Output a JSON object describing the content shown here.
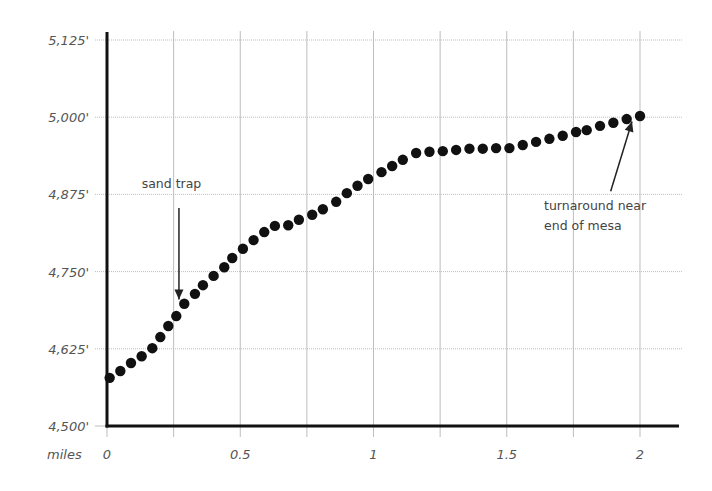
{
  "chart_data": {
    "type": "scatter",
    "title": "",
    "xlabel": "miles",
    "ylabel": "",
    "xlim": [
      0,
      2
    ],
    "ylim": [
      4500,
      5125
    ],
    "x_ticks": [
      0,
      0.5,
      1,
      1.5,
      2
    ],
    "x_tick_labels": [
      "0",
      "0.5",
      "1",
      "1.5",
      "2"
    ],
    "x_gridlines": [
      0.25,
      0.5,
      0.75,
      1,
      1.25,
      1.5,
      1.75,
      2
    ],
    "y_ticks": [
      4500,
      4625,
      4750,
      4875,
      5000,
      5125
    ],
    "y_tick_labels": [
      "4,500'",
      "4,625'",
      "4,750'",
      "4,875'",
      "5,000'",
      "5,125'"
    ],
    "grid": true,
    "legend": null,
    "series": [
      {
        "name": "elevation",
        "color": "#111111",
        "x": [
          0.01,
          0.05,
          0.09,
          0.13,
          0.17,
          0.2,
          0.23,
          0.26,
          0.29,
          0.33,
          0.36,
          0.4,
          0.44,
          0.47,
          0.51,
          0.55,
          0.59,
          0.63,
          0.68,
          0.72,
          0.77,
          0.81,
          0.86,
          0.9,
          0.94,
          0.98,
          1.03,
          1.07,
          1.11,
          1.16,
          1.21,
          1.26,
          1.31,
          1.36,
          1.41,
          1.46,
          1.51,
          1.56,
          1.61,
          1.66,
          1.71,
          1.76,
          1.8,
          1.85,
          1.9,
          1.95,
          2.0
        ],
        "y": [
          4578,
          4589,
          4602,
          4613,
          4626,
          4644,
          4662,
          4678,
          4698,
          4714,
          4728,
          4743,
          4757,
          4772,
          4787,
          4801,
          4814,
          4824,
          4825,
          4834,
          4842,
          4851,
          4863,
          4877,
          4889,
          4900,
          4911,
          4921,
          4931,
          4942,
          4944,
          4945,
          4947,
          4949,
          4949,
          4950,
          4950,
          4955,
          4960,
          4965,
          4970,
          4976,
          4979,
          4986,
          4991,
          4997,
          5002
        ]
      }
    ],
    "annotations": [
      {
        "lines": [
          "sand trap"
        ],
        "text_x": 0.13,
        "text_y": 4885,
        "arrow_from": [
          0.27,
          4853
        ],
        "arrow_to": [
          0.27,
          4705
        ]
      },
      {
        "lines": [
          "turnaround near",
          "end of mesa"
        ],
        "text_x": 1.64,
        "text_y": 4850,
        "arrow_from": [
          1.89,
          4880
        ],
        "arrow_to": [
          1.97,
          4993
        ]
      }
    ]
  }
}
